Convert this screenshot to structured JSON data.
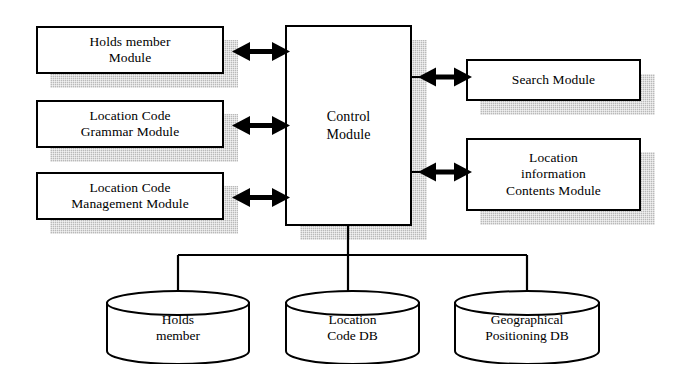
{
  "diagram": {
    "colors": {
      "stroke": "#000000",
      "fill": "#ffffff",
      "shadow": "#b9b9b9"
    },
    "left_modules": [
      {
        "id": "holds-member-module",
        "label": "Holds member\nModule"
      },
      {
        "id": "location-code-grammar-module",
        "label": "Location Code\nGrammar Module"
      },
      {
        "id": "location-code-management-module",
        "label": "Location Code\nManagement Module"
      }
    ],
    "center_module": {
      "id": "control-module",
      "label": "Control\nModule"
    },
    "right_modules": [
      {
        "id": "search-module",
        "label": "Search Module"
      },
      {
        "id": "location-information-contents-module",
        "label": "Location\ninformation\nContents Module"
      }
    ],
    "databases": [
      {
        "id": "holds-member-db",
        "label": "Holds\nmember"
      },
      {
        "id": "location-code-db",
        "label": "Location\nCode DB"
      },
      {
        "id": "geographical-positioning-db",
        "label": "Geographical\nPositioning DB"
      }
    ],
    "connectors": [
      {
        "id": "holds-member-to-control",
        "type": "double-arrow",
        "from": "holds-member-module",
        "to": "control-module"
      },
      {
        "id": "grammar-to-control",
        "type": "double-arrow",
        "from": "location-code-grammar-module",
        "to": "control-module"
      },
      {
        "id": "management-to-control",
        "type": "double-arrow",
        "from": "location-code-management-module",
        "to": "control-module"
      },
      {
        "id": "control-to-search",
        "type": "double-arrow",
        "from": "control-module",
        "to": "search-module"
      },
      {
        "id": "control-to-location-information",
        "type": "double-arrow",
        "from": "control-module",
        "to": "location-information-contents-module"
      },
      {
        "id": "control-to-databases-bus",
        "type": "line",
        "from": "control-module",
        "to": "databases"
      }
    ]
  }
}
